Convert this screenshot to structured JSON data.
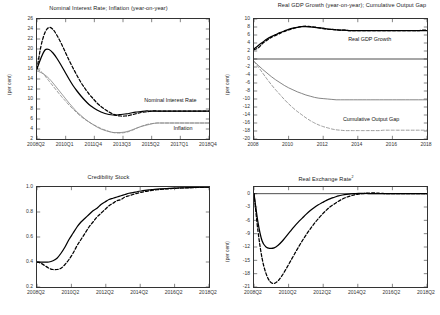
{
  "figure": {
    "background": "#ffffff",
    "series_colors": {
      "baseline": "#000000",
      "alternative": "#000000",
      "grey": "#8a8a8a"
    }
  },
  "panels": {
    "top_left": {
      "title": "Nominal Interest Rate; Inflation (year-on-year)",
      "ylabel": "(per cent)",
      "annotation_interest": "Nominal Interest Rate",
      "annotation_inflation": "Inflation"
    },
    "top_right": {
      "title": "Real GDP Growth (year-on-year); Cumulative Output Gap",
      "ylabel": "(per cent)",
      "annotation_gdp": "Real GDP Growth",
      "annotation_gap": "Cumulative Output Gap"
    },
    "bottom_left": {
      "title": "Credibility Stock",
      "ylabel": ""
    },
    "bottom_right": {
      "title": "Real Exchange Rate",
      "title_superscript": "2",
      "ylabel": "(per cent)"
    }
  },
  "chart_data": [
    {
      "id": "nominal-interest-inflation",
      "type": "line",
      "title": "Nominal Interest Rate; Inflation (year-on-year)",
      "xlabel": "",
      "ylabel": "(per cent)",
      "ylim": [
        2,
        26
      ],
      "ytick_labels": [
        "2",
        "4",
        "6",
        "8",
        "10",
        "12",
        "14",
        "16",
        "18",
        "20",
        "22",
        "24",
        "26"
      ],
      "yticks": [
        2,
        4,
        6,
        8,
        10,
        12,
        14,
        16,
        18,
        20,
        22,
        24,
        26
      ],
      "xtick_labels": [
        "2008Q2",
        "2010Q1",
        "2011Q4",
        "2013Q3",
        "2015Q2",
        "2017Q1",
        "2018Q4"
      ],
      "x": [
        0,
        1,
        2,
        3,
        4,
        5,
        6,
        7,
        8,
        9,
        10,
        11,
        12,
        13,
        14,
        15,
        16,
        17,
        18,
        19,
        20,
        21,
        22,
        23,
        24,
        25,
        26,
        27,
        28,
        29,
        30,
        31,
        32,
        33,
        34,
        35,
        36,
        37,
        38,
        39,
        40,
        41,
        42,
        43
      ],
      "grid": false,
      "legend": "inline-annotations",
      "series": [
        {
          "name": "Nominal Interest Rate (baseline)",
          "style": "solid",
          "color": "#000000",
          "values": [
            16.0,
            18.2,
            19.8,
            19.9,
            19.2,
            18.1,
            16.8,
            15.4,
            14.0,
            12.7,
            11.6,
            10.6,
            9.7,
            8.9,
            8.3,
            7.8,
            7.4,
            7.1,
            6.9,
            6.8,
            6.8,
            6.9,
            7.0,
            7.1,
            7.3,
            7.4,
            7.5,
            7.6,
            7.6,
            7.6,
            7.6,
            7.6,
            7.6,
            7.6,
            7.6,
            7.6,
            7.6,
            7.6,
            7.6,
            7.6,
            7.6,
            7.6,
            7.6,
            7.6
          ]
        },
        {
          "name": "Nominal Interest Rate (alternative)",
          "style": "dashed",
          "color": "#000000",
          "values": [
            16.0,
            20.6,
            23.3,
            24.3,
            23.9,
            22.7,
            21.2,
            19.5,
            17.8,
            16.2,
            14.7,
            13.3,
            12.1,
            11.0,
            10.1,
            9.2,
            8.5,
            7.9,
            7.4,
            7.0,
            6.7,
            6.6,
            6.6,
            6.7,
            6.9,
            7.1,
            7.3,
            7.4,
            7.5,
            7.6,
            7.6,
            7.6,
            7.6,
            7.6,
            7.6,
            7.6,
            7.6,
            7.6,
            7.6,
            7.6,
            7.6,
            7.6,
            7.6,
            7.6
          ]
        },
        {
          "name": "Inflation (baseline)",
          "style": "solid",
          "color": "#8a8a8a",
          "values": [
            15.6,
            15.3,
            14.8,
            14.1,
            13.2,
            12.2,
            11.2,
            10.2,
            9.2,
            8.3,
            7.4,
            6.7,
            6.0,
            5.4,
            4.9,
            4.4,
            4.0,
            3.7,
            3.5,
            3.3,
            3.3,
            3.3,
            3.4,
            3.6,
            3.9,
            4.2,
            4.5,
            4.7,
            4.9,
            5.1,
            5.2,
            5.2,
            5.2,
            5.2,
            5.2,
            5.2,
            5.2,
            5.2,
            5.2,
            5.2,
            5.2,
            5.2,
            5.2,
            5.2
          ]
        },
        {
          "name": "Inflation (alternative)",
          "style": "dashed",
          "color": "#8a8a8a",
          "values": [
            15.9,
            15.5,
            14.6,
            13.6,
            12.6,
            11.6,
            10.6,
            9.7,
            8.8,
            8.0,
            7.2,
            6.5,
            5.9,
            5.4,
            4.9,
            4.5,
            4.1,
            3.8,
            3.5,
            3.3,
            3.2,
            3.2,
            3.3,
            3.5,
            3.8,
            4.2,
            4.5,
            4.8,
            5.0,
            5.1,
            5.2,
            5.2,
            5.2,
            5.2,
            5.2,
            5.2,
            5.2,
            5.2,
            5.2,
            5.2,
            5.2,
            5.2,
            5.2,
            5.2
          ]
        }
      ],
      "annotations": [
        {
          "text": "Nominal Interest Rate",
          "x_frac": 0.63,
          "y_value": 9.6
        },
        {
          "text": "Inflation",
          "x_frac": 0.8,
          "y_value": 4.0
        }
      ]
    },
    {
      "id": "gdp-growth-output-gap",
      "type": "line",
      "title": "Real GDP Growth (year-on-year); Cumulative Output Gap",
      "xlabel": "",
      "ylabel": "(per cent)",
      "ylim": [
        -20,
        10
      ],
      "ytick_labels": [
        "-20",
        "-18",
        "-16",
        "-14",
        "-12",
        "-10",
        "-8",
        "-6",
        "-4",
        "-2",
        "0",
        "2",
        "4",
        "6",
        "8",
        "10"
      ],
      "yticks": [
        -20,
        -18,
        -16,
        -14,
        -12,
        -10,
        -8,
        -6,
        -4,
        -2,
        0,
        2,
        4,
        6,
        8,
        10
      ],
      "xtick_labels": [
        "2008",
        "2010",
        "2012",
        "2014",
        "2016",
        "2018"
      ],
      "grid": false,
      "zero_line": true,
      "series": [
        {
          "name": "Real GDP Growth (baseline)",
          "style": "solid",
          "color": "#000000",
          "values": [
            2.5,
            3.4,
            4.2,
            5.0,
            5.6,
            6.1,
            6.6,
            7.0,
            7.4,
            7.7,
            7.9,
            8.1,
            8.1,
            8.0,
            7.9,
            7.8,
            7.7,
            7.5,
            7.4,
            7.3,
            7.2,
            7.2,
            7.1,
            7.1,
            7.1,
            7.1,
            7.1,
            7.1,
            7.1,
            7.1,
            7.1,
            7.1,
            7.1,
            7.1,
            7.1,
            7.1,
            7.1,
            7.1,
            7.1,
            7.1,
            7.1
          ]
        },
        {
          "name": "Real GDP Growth (alternative)",
          "style": "dashed",
          "color": "#000000",
          "values": [
            2.3,
            2.8,
            3.9,
            4.7,
            5.4,
            5.9,
            6.4,
            6.9,
            7.3,
            7.6,
            7.9,
            8.1,
            8.2,
            8.1,
            8.0,
            7.8,
            7.6,
            7.5,
            7.4,
            7.3,
            7.2,
            7.2,
            7.1,
            7.1,
            7.1,
            7.1,
            7.1,
            7.1,
            7.1,
            7.1,
            7.1,
            7.1,
            7.1,
            7.1,
            7.1,
            7.1,
            7.1,
            7.1,
            7.1,
            7.2,
            7.2
          ]
        },
        {
          "name": "Cumulative Output Gap (baseline)",
          "style": "solid",
          "color": "#6f6f6f",
          "values": [
            -0.6,
            -1.6,
            -2.6,
            -3.5,
            -4.4,
            -5.2,
            -5.9,
            -6.6,
            -7.2,
            -7.7,
            -8.2,
            -8.6,
            -9.0,
            -9.3,
            -9.6,
            -9.8,
            -9.9,
            -10.0,
            -10.1,
            -10.2,
            -10.2,
            -10.2,
            -10.2,
            -10.2,
            -10.2,
            -10.2,
            -10.2,
            -10.2,
            -10.2,
            -10.2,
            -10.2,
            -10.2,
            -10.2,
            -10.2,
            -10.2,
            -10.2,
            -10.2,
            -10.2,
            -10.2,
            -10.2,
            -10.2
          ]
        },
        {
          "name": "Cumulative Output Gap (alternative)",
          "style": "dashed",
          "color": "#8a8a8a",
          "values": [
            -0.6,
            -2.0,
            -3.5,
            -5.0,
            -6.4,
            -7.7,
            -8.9,
            -10.1,
            -11.2,
            -12.2,
            -13.1,
            -13.9,
            -14.7,
            -15.4,
            -16.0,
            -16.5,
            -16.9,
            -17.2,
            -17.5,
            -17.7,
            -17.8,
            -17.9,
            -17.9,
            -17.9,
            -17.9,
            -17.9,
            -17.9,
            -17.9,
            -17.9,
            -17.9,
            -17.8,
            -17.8,
            -17.8,
            -17.8,
            -17.8,
            -17.8,
            -17.8,
            -17.8,
            -17.8,
            -17.8,
            -17.8
          ]
        }
      ],
      "annotations": [
        {
          "text": "Real GDP Growth",
          "x_frac": 0.55,
          "y_value": 4.6
        },
        {
          "text": "Cumulative Output Gap",
          "x_frac": 0.52,
          "y_value": -15.3
        }
      ]
    },
    {
      "id": "credibility-stock",
      "type": "line",
      "title": "Credibility Stock",
      "xlabel": "",
      "ylabel": "",
      "ylim": [
        0.2,
        1.0
      ],
      "ytick_labels": [
        "0.2",
        "0.4",
        "0.6",
        "0.8",
        "1.0"
      ],
      "yticks": [
        0.2,
        0.4,
        0.6,
        0.8,
        1.0
      ],
      "xtick_labels": [
        "2008Q2",
        "2010Q2",
        "2012Q2",
        "2014Q2",
        "2016Q2",
        "2018Q2"
      ],
      "grid": false,
      "series": [
        {
          "name": "Credibility Stock (baseline)",
          "style": "solid",
          "color": "#000000",
          "values": [
            0.4,
            0.4,
            0.4,
            0.4,
            0.41,
            0.43,
            0.47,
            0.52,
            0.58,
            0.63,
            0.68,
            0.72,
            0.75,
            0.78,
            0.81,
            0.83,
            0.86,
            0.88,
            0.9,
            0.91,
            0.92,
            0.93,
            0.94,
            0.95,
            0.955,
            0.962,
            0.968,
            0.973,
            0.977,
            0.98,
            0.983,
            0.985,
            0.987,
            0.989,
            0.991,
            0.992,
            0.993,
            0.994,
            0.995,
            0.996,
            0.997,
            0.998,
            0.998,
            0.999
          ]
        },
        {
          "name": "Credibility Stock (alternative)",
          "style": "dashed",
          "color": "#000000",
          "values": [
            0.4,
            0.39,
            0.37,
            0.35,
            0.34,
            0.34,
            0.35,
            0.38,
            0.42,
            0.47,
            0.53,
            0.58,
            0.63,
            0.68,
            0.72,
            0.76,
            0.79,
            0.82,
            0.85,
            0.87,
            0.89,
            0.9,
            0.92,
            0.93,
            0.94,
            0.949,
            0.957,
            0.964,
            0.969,
            0.974,
            0.978,
            0.981,
            0.984,
            0.986,
            0.988,
            0.99,
            0.992,
            0.993,
            0.994,
            0.995,
            0.996,
            0.997,
            0.998,
            0.999
          ]
        }
      ]
    },
    {
      "id": "real-exchange-rate",
      "type": "line",
      "title": "Real Exchange Rate",
      "title_superscript": "2",
      "xlabel": "",
      "ylabel": "(per cent)",
      "ylim": [
        -21,
        1.5
      ],
      "ytick_labels": [
        "-21",
        "-18",
        "-15",
        "-12",
        "-9",
        "-6",
        "-3",
        "0"
      ],
      "yticks": [
        -21,
        -18,
        -15,
        -12,
        -9,
        -6,
        -3,
        0
      ],
      "xtick_labels": [
        "2008Q2",
        "2010Q2",
        "2012Q2",
        "2014Q2",
        "2016Q2",
        "2018Q2"
      ],
      "grid": false,
      "zero_line": true,
      "series": [
        {
          "name": "Real Exchange Rate (baseline)",
          "style": "solid",
          "color": "#000000",
          "values": [
            0.0,
            -6.5,
            -10.6,
            -12.0,
            -12.3,
            -12.2,
            -11.6,
            -10.7,
            -9.6,
            -8.5,
            -7.4,
            -6.4,
            -5.5,
            -4.6,
            -3.8,
            -3.1,
            -2.5,
            -2.0,
            -1.5,
            -1.1,
            -0.8,
            -0.5,
            -0.3,
            -0.15,
            -0.05,
            0.0,
            0.05,
            0.05,
            0.05,
            0.0,
            0.0,
            0.0,
            0.0,
            0.0,
            0.0,
            0.0,
            0.0,
            0.0,
            0.0,
            0.0,
            0.0,
            0.0,
            0.0,
            0.0
          ]
        },
        {
          "name": "Real Exchange Rate (alternative)",
          "style": "dashed",
          "color": "#000000",
          "values": [
            0.0,
            -8.5,
            -14.5,
            -18.0,
            -19.8,
            -20.2,
            -19.6,
            -18.4,
            -16.9,
            -15.3,
            -13.7,
            -12.1,
            -10.6,
            -9.2,
            -7.9,
            -6.7,
            -5.6,
            -4.6,
            -3.7,
            -2.9,
            -2.3,
            -1.7,
            -1.2,
            -0.8,
            -0.5,
            -0.25,
            -0.1,
            0.0,
            0.1,
            0.15,
            0.15,
            0.1,
            0.05,
            0.0,
            0.0,
            0.0,
            0.0,
            0.0,
            0.0,
            0.0,
            0.0,
            0.0,
            0.0,
            0.0
          ]
        }
      ]
    }
  ]
}
